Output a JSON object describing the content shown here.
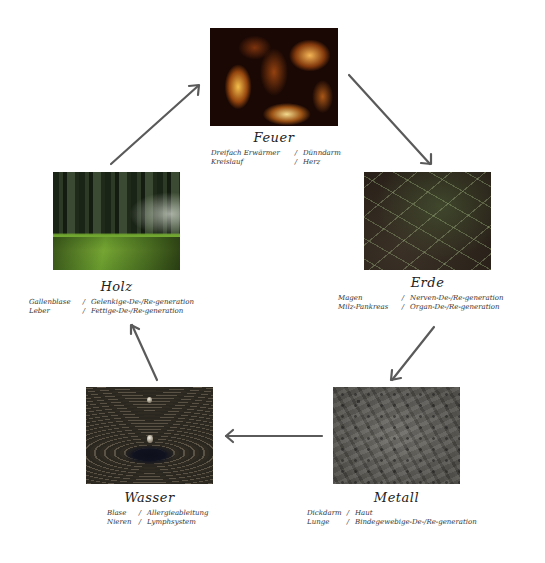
{
  "diagram": {
    "type": "five-element-cycle",
    "cycle_order": [
      "Feuer",
      "Erde",
      "Metall",
      "Wasser",
      "Holz"
    ],
    "arrow_color": "#5a5a5a",
    "elements": [
      {
        "key": "feuer",
        "title": "Feuer",
        "image": "fire-photo",
        "rows": [
          {
            "organ": "Dreifach Erwärmer",
            "sep": "/",
            "function": "Dünndarm"
          },
          {
            "organ": "Kreislauf",
            "sep": "/",
            "function": "Herz"
          }
        ]
      },
      {
        "key": "erde",
        "title": "Erde",
        "image": "earth-grass-photo",
        "rows": [
          {
            "organ": "Magen",
            "sep": "/",
            "function": "Nerven-De-/Re-generation"
          },
          {
            "organ": "Milz-Pankreas",
            "sep": "/",
            "function": "Organ-De-/Re-generation"
          }
        ]
      },
      {
        "key": "metall",
        "title": "Metall",
        "image": "metal-texture-photo",
        "rows": [
          {
            "organ": "Dickdarm",
            "sep": "/",
            "function": "Haut"
          },
          {
            "organ": "Lunge",
            "sep": "/",
            "function": "Bindegewebige-De-/Re-generation"
          }
        ]
      },
      {
        "key": "wasser",
        "title": "Wasser",
        "image": "water-drop-photo",
        "rows": [
          {
            "organ": "Blase",
            "sep": "/",
            "function": "Allergieableitung"
          },
          {
            "organ": "Nieren",
            "sep": "/",
            "function": "Lymphsystem"
          }
        ]
      },
      {
        "key": "holz",
        "title": "Holz",
        "image": "forest-photo",
        "rows": [
          {
            "organ": "Gallenblase",
            "sep": "/",
            "function": "Gelenkige-De-/Re-generation"
          },
          {
            "organ": "Leber",
            "sep": "/",
            "function": "Fettige-De-/Re-generation"
          }
        ]
      }
    ]
  }
}
